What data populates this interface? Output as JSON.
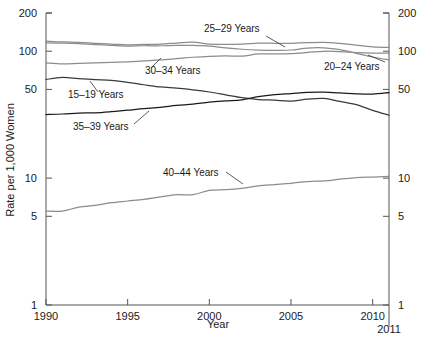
{
  "chart_data": {
    "type": "line",
    "title": "",
    "xlabel": "Year",
    "ylabel": "Rate per 1,000 Women",
    "yscale": "log",
    "ylim": [
      1,
      200
    ],
    "xlim": [
      1990,
      2011
    ],
    "grid": false,
    "legend_position": "inline-annotations",
    "y_ticks": [
      "1",
      "5",
      "10",
      "50",
      "100",
      "200"
    ],
    "y_tick_values": [
      1,
      5,
      10,
      50,
      100,
      200
    ],
    "x_ticks": [
      "1990",
      "1995",
      "2000",
      "2005",
      "2010"
    ],
    "x_tick_values": [
      1990,
      1995,
      2000,
      2005,
      2010
    ],
    "x_end_label": "2011",
    "x": [
      1990,
      1991,
      1992,
      1993,
      1994,
      1995,
      1996,
      1997,
      1998,
      1999,
      2000,
      2001,
      2002,
      2003,
      2004,
      2005,
      2006,
      2007,
      2008,
      2009,
      2010,
      2011
    ],
    "series": [
      {
        "name": "20-24 Years",
        "label": "20–24 Years",
        "color": "#8c8c8c",
        "values": [
          116.5,
          115.7,
          114.6,
          112.6,
          111.1,
          109.8,
          110.4,
          110.4,
          111.2,
          111.0,
          109.7,
          106.2,
          103.6,
          102.1,
          101.7,
          102.2,
          105.9,
          106.3,
          103.0,
          96.3,
          90.0,
          85.3
        ]
      },
      {
        "name": "25-29 Years",
        "label": "25–29 Years",
        "color": "#8c8c8c",
        "values": [
          120.2,
          118.2,
          117.4,
          115.5,
          113.9,
          112.2,
          113.1,
          113.8,
          115.9,
          117.8,
          113.5,
          113.4,
          113.6,
          115.6,
          115.5,
          115.5,
          116.8,
          117.5,
          115.1,
          111.5,
          108.3,
          107.2
        ]
      },
      {
        "name": "30-34 Years",
        "label": "30–34 Years",
        "color": "#8c8c8c",
        "values": [
          80.8,
          79.5,
          80.2,
          80.8,
          81.5,
          82.5,
          83.9,
          85.3,
          87.4,
          89.6,
          91.2,
          91.9,
          91.5,
          95.1,
          95.3,
          95.8,
          97.7,
          99.9,
          99.3,
          97.5,
          96.5,
          96.5
        ]
      },
      {
        "name": "15-19 Years",
        "label": "15–19 Years",
        "color": "#3a3a3a",
        "values": [
          59.9,
          62.1,
          60.7,
          59.6,
          58.9,
          56.8,
          54.4,
          52.3,
          51.1,
          49.6,
          47.7,
          45.3,
          43.0,
          41.6,
          41.1,
          40.5,
          41.9,
          42.5,
          40.2,
          37.9,
          34.2,
          31.3
        ]
      },
      {
        "name": "35-39 Years",
        "label": "35–39 Years",
        "color": "#1a1a1a",
        "values": [
          31.7,
          32.0,
          32.5,
          32.7,
          33.4,
          34.3,
          35.3,
          36.1,
          37.4,
          38.3,
          39.7,
          40.6,
          41.4,
          43.8,
          45.4,
          46.3,
          47.3,
          47.5,
          46.9,
          46.1,
          45.9,
          47.2
        ]
      },
      {
        "name": "40-44 Years",
        "label": "40–44 Years",
        "color": "#8c8c8c",
        "values": [
          5.5,
          5.5,
          5.9,
          6.1,
          6.4,
          6.6,
          6.8,
          7.1,
          7.4,
          7.4,
          8.0,
          8.1,
          8.3,
          8.7,
          8.9,
          9.1,
          9.4,
          9.5,
          9.8,
          10.1,
          10.2,
          10.3
        ]
      }
    ],
    "annotations": [
      {
        "text": "25–29 Years",
        "x": 204,
        "y": 32
      },
      {
        "text": "20–24 Years",
        "x": 324,
        "y": 70
      },
      {
        "text": "30–34 Years",
        "x": 145,
        "y": 74
      },
      {
        "text": "15–19 Years",
        "x": 68,
        "y": 98
      },
      {
        "text": "35–39 Years",
        "x": 73,
        "y": 130
      },
      {
        "text": "40–44 Years",
        "x": 163,
        "y": 176
      }
    ]
  }
}
